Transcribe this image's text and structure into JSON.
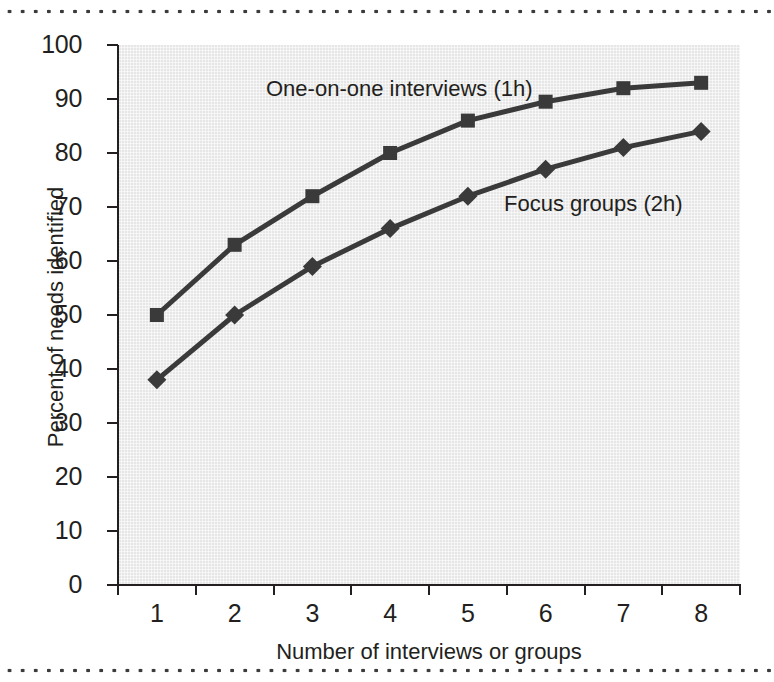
{
  "figure": {
    "background_color": "#ffffff",
    "plot_background_color": "#e6e6e6",
    "line_color": "#3a3a3a",
    "text_color": "#231f20",
    "rule_style": "dotted"
  },
  "chart_data": {
    "type": "line",
    "title": "",
    "subtitle": "",
    "xlabel": "Number of interviews or groups",
    "ylabel": "Percent of needs identified",
    "categories": [
      "1",
      "2",
      "3",
      "4",
      "5",
      "6",
      "7",
      "8"
    ],
    "x": [
      1,
      2,
      3,
      4,
      5,
      6,
      7,
      8
    ],
    "xlim": [
      0.5,
      8.5
    ],
    "ylim": [
      0,
      100
    ],
    "yticks": [
      0,
      10,
      20,
      30,
      40,
      50,
      60,
      70,
      80,
      90,
      100
    ],
    "ytick_labels": [
      "0",
      "10",
      "20",
      "30",
      "40",
      "50",
      "60",
      "70",
      "80",
      "90",
      "100"
    ],
    "xtick_labels": [
      "1",
      "2",
      "3",
      "4",
      "5",
      "6",
      "7",
      "8"
    ],
    "grid": false,
    "legend_position": "in-plot annotations",
    "series": [
      {
        "name": "One-on-one interviews (1h)",
        "marker": "square",
        "color": "#3a3a3a",
        "values": [
          50,
          63,
          72,
          80,
          86,
          89.5,
          92,
          93
        ]
      },
      {
        "name": "Focus groups (2h)",
        "marker": "diamond",
        "color": "#3a3a3a",
        "values": [
          38,
          50,
          59,
          66,
          72,
          77,
          81,
          84
        ]
      }
    ],
    "annotations": [
      {
        "text": "One-on-one interviews (1h)",
        "series": "One-on-one interviews (1h)"
      },
      {
        "text": "Focus groups (2h)",
        "series": "Focus groups (2h)"
      }
    ]
  }
}
